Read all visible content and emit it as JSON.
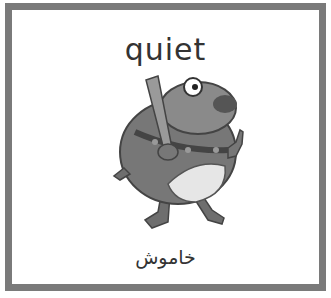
{
  "card": {
    "word": "quiet",
    "translation": "خاموش",
    "illustration": "cartoon-dog-with-bat-icon",
    "frame_color": "#7a7a7a"
  }
}
